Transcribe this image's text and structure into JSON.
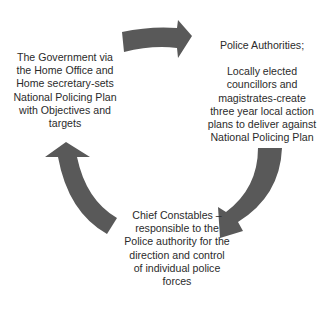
{
  "diagram": {
    "type": "cycle",
    "arrow_color": "#595959",
    "background_color": "#ffffff",
    "text_color": "#2b2b2b",
    "nodes": [
      {
        "id": "government",
        "position": "left",
        "lines": [
          "The Government via",
          "the Home Office and",
          "Home secretary-sets",
          "National Policing Plan",
          "with Objectives and",
          "targets"
        ]
      },
      {
        "id": "police-authorities",
        "position": "top-right",
        "title": "Police Authorities;",
        "lines": [
          "Locally elected",
          "councillors and",
          "magistrates-create",
          "three year local action",
          "plans to deliver against",
          "National Policing Plan"
        ]
      },
      {
        "id": "chief-constables",
        "position": "bottom",
        "lines": [
          "Chief Constables –",
          "responsible to the",
          "Police authority for the",
          "direction and control",
          "of individual police",
          "forces"
        ]
      }
    ],
    "arrows": [
      {
        "from": "government",
        "to": "police-authorities",
        "direction": "clockwise"
      },
      {
        "from": "police-authorities",
        "to": "chief-constables",
        "direction": "clockwise"
      },
      {
        "from": "chief-constables",
        "to": "government",
        "direction": "clockwise"
      }
    ]
  }
}
